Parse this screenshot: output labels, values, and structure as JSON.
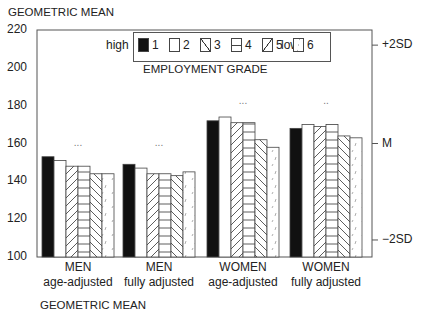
{
  "chart_data": {
    "type": "bar",
    "title": "GEOMETRIC MEAN",
    "ylabel": "GEOMETRIC MEAN",
    "xlabel": "",
    "ylim": [
      100,
      220
    ],
    "yticks": [
      100,
      120,
      140,
      160,
      180,
      200,
      220
    ],
    "right_axis_labels": [
      "+2SD",
      "M",
      "−2SD"
    ],
    "right_axis_values": [
      212,
      160,
      109
    ],
    "categories": [
      "MEN age-adjusted",
      "MEN fully adjusted",
      "WOMEN age-adjusted",
      "WOMEN fully adjusted"
    ],
    "category_lines": [
      [
        "MEN",
        "age-adjusted"
      ],
      [
        "MEN",
        "fully adjusted"
      ],
      [
        "WOMEN",
        "age-adjusted"
      ],
      [
        "WOMEN",
        "fully adjusted"
      ]
    ],
    "legend": {
      "title": "EMPLOYMENT GRADE",
      "left_label": "high",
      "right_label": "low",
      "entries": [
        "1",
        "2",
        "3",
        "4",
        "5",
        "6"
      ],
      "position": "top-center"
    },
    "trend_markers": [
      "...",
      "...",
      "...",
      ".."
    ],
    "series": [
      {
        "name": "1",
        "pattern": "solid-black",
        "values": [
          153,
          149,
          172,
          168
        ]
      },
      {
        "name": "2",
        "pattern": "white",
        "values": [
          151,
          147,
          174,
          170
        ]
      },
      {
        "name": "3",
        "pattern": "diagonal-up",
        "values": [
          148,
          144,
          171,
          169
        ]
      },
      {
        "name": "4",
        "pattern": "horizontal",
        "values": [
          148,
          144,
          171,
          170
        ]
      },
      {
        "name": "5",
        "pattern": "diagonal-down",
        "values": [
          144,
          143,
          162,
          164
        ]
      },
      {
        "name": "6",
        "pattern": "sparse-dash",
        "values": [
          144,
          145,
          158,
          163
        ]
      }
    ],
    "grid": false
  },
  "bottom_clipped_label": "GEOMETRIC MEAN"
}
